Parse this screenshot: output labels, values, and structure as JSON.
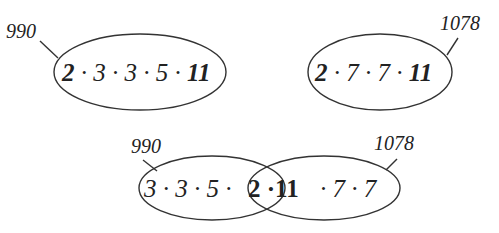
{
  "diagram": {
    "top_left": {
      "number_label": "990",
      "factors": [
        {
          "text": "2",
          "bold": true
        },
        {
          "text": " · 3 · 3 · 5 · ",
          "bold": false
        },
        {
          "text": "11",
          "bold": true
        }
      ]
    },
    "top_right": {
      "number_label": "1078",
      "factors": [
        {
          "text": "2",
          "bold": true
        },
        {
          "text": " · 7 · 7 · ",
          "bold": false
        },
        {
          "text": "11",
          "bold": true
        }
      ]
    },
    "venn": {
      "left_label": "990",
      "right_label": "1078",
      "left_only": "3 · 3 · 5 · ",
      "intersection": "2 ·11",
      "right_only": "· 7 · 7"
    },
    "colors": {
      "stroke": "#333333",
      "text": "#222222",
      "background": "#ffffff"
    }
  }
}
